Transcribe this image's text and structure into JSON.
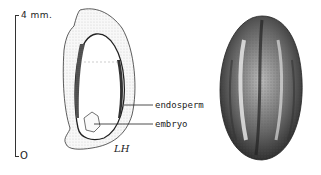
{
  "figure": {
    "scale_bar": {
      "top_label": "4 mm.",
      "bottom_label": "O"
    },
    "section_drawing": {
      "labels": [
        {
          "text": "endosperm"
        },
        {
          "text": "embryo"
        }
      ],
      "signature": "LH"
    },
    "external_view": {
      "description": "whole seed, external view"
    },
    "colors": {
      "ink": "#222222",
      "background": "#ffffff"
    }
  }
}
